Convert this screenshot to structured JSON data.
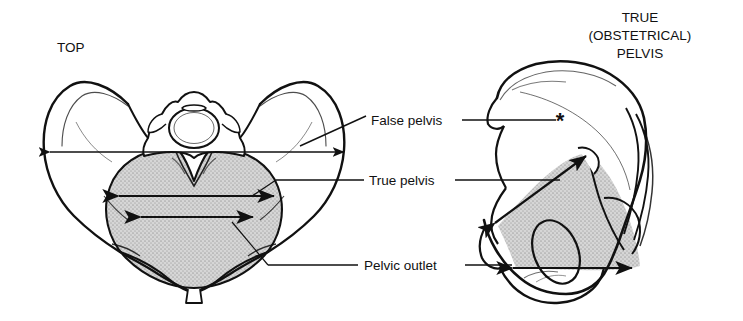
{
  "figure": {
    "kind": "medical-illustration",
    "background_color": "#ffffff",
    "ink_color": "#111111",
    "shade_color": "#c9c9c9"
  },
  "titles": {
    "left_view": "TOP",
    "right_view_line1": "TRUE",
    "right_view_line2": "(OBSTETRICAL)",
    "right_view_line3": "PELVIS"
  },
  "labels": {
    "false_pelvis": "False pelvis",
    "true_pelvis": "True pelvis",
    "pelvic_outlet": "Pelvic outlet",
    "asterisk_marker": "*"
  },
  "panels": [
    {
      "name": "top-view",
      "title": "TOP",
      "measurements": [
        {
          "name": "false-pelvis-width-arrow",
          "style": "double-headed",
          "orientation": "horizontal"
        },
        {
          "name": "true-pelvis-inlet-arrow",
          "style": "double-headed",
          "orientation": "horizontal"
        },
        {
          "name": "pelvic-outlet-arrow",
          "style": "double-headed",
          "orientation": "horizontal"
        }
      ]
    },
    {
      "name": "lateral-view",
      "title": "TRUE (OBSTETRICAL) PELVIS",
      "measurements": [
        {
          "name": "true-pelvis-inlet-arrow",
          "style": "double-headed",
          "orientation": "diagonal"
        },
        {
          "name": "pelvic-outlet-arrow",
          "style": "double-headed",
          "orientation": "horizontal"
        }
      ]
    }
  ]
}
